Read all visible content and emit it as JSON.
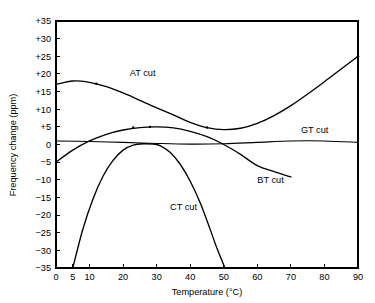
{
  "chart_data": {
    "type": "line",
    "title": "",
    "xlabel": "Temperature (°C)",
    "ylabel": "Frequency change (ppm)",
    "xlim": [
      0,
      90
    ],
    "ylim": [
      -35,
      35
    ],
    "grid": false,
    "legend_position": "inline-curve-labels",
    "x_ticks": [
      0,
      5,
      10,
      20,
      30,
      40,
      50,
      60,
      70,
      80,
      90
    ],
    "x_tick_labels": [
      "0",
      "5",
      "10",
      "20",
      "30",
      "40",
      "50",
      "60",
      "70",
      "80",
      "90"
    ],
    "y_ticks": [
      -35,
      -30,
      -25,
      -20,
      -15,
      -10,
      -5,
      0,
      5,
      10,
      15,
      20,
      25,
      30,
      35
    ],
    "y_tick_labels": [
      "−35",
      "−30",
      "−25",
      "−20",
      "−15",
      "−10",
      "−5",
      "0",
      "+5",
      "+10",
      "+15",
      "+20",
      "+25",
      "+30",
      "+35"
    ],
    "series": [
      {
        "name": "AT cut",
        "label": "AT cut",
        "label_x": 22,
        "label_y": 19.5,
        "x": [
          0,
          5,
          10,
          15,
          20,
          25,
          30,
          35,
          40,
          45,
          50,
          55,
          60,
          65,
          70,
          75,
          80,
          85,
          90
        ],
        "y": [
          17.0,
          18.0,
          17.6,
          16.4,
          14.6,
          12.5,
          10.4,
          8.4,
          6.3,
          4.8,
          4.2,
          4.6,
          6.0,
          8.2,
          11.0,
          14.3,
          17.8,
          21.4,
          25.0
        ],
        "markers": [
          {
            "x": 12,
            "y": 17.2
          },
          {
            "x": 45,
            "y": 4.8
          },
          {
            "x": 90,
            "y": 25.0
          }
        ]
      },
      {
        "name": "BT cut",
        "label": "BT cut",
        "label_x": 60,
        "label_y": -11.0,
        "x": [
          0,
          5,
          10,
          15,
          20,
          25,
          30,
          35,
          40,
          45,
          50,
          55,
          60,
          65,
          70
        ],
        "y": [
          -5.0,
          -1.6,
          1.0,
          2.9,
          4.1,
          4.8,
          5.0,
          4.7,
          3.7,
          2.2,
          0.0,
          -2.8,
          -6.0,
          -7.7,
          -9.2
        ],
        "markers": [
          {
            "x": 23,
            "y": 4.8
          },
          {
            "x": 28,
            "y": 5.0
          }
        ]
      },
      {
        "name": "CT cut",
        "label": "CT cut",
        "label_x": 34,
        "label_y": -18.5,
        "x": [
          5,
          8,
          11,
          14,
          17,
          20,
          23,
          26,
          29,
          31,
          34,
          37,
          40,
          43,
          46,
          48,
          51
        ],
        "y": [
          -35.0,
          -24.0,
          -15.5,
          -9.0,
          -4.5,
          -1.6,
          -0.2,
          0.2,
          0.1,
          -0.3,
          -2.2,
          -5.6,
          -10.4,
          -16.6,
          -24.2,
          -29.5,
          -36.5
        ]
      },
      {
        "name": "GT cut",
        "label": "GT cut",
        "label_x": 73,
        "label_y": 3.2,
        "x": [
          0,
          10,
          20,
          30,
          40,
          50,
          60,
          70,
          80,
          90
        ],
        "y": [
          1.0,
          0.85,
          0.6,
          0.3,
          0.1,
          0.2,
          0.6,
          1.0,
          1.0,
          0.6
        ]
      }
    ]
  }
}
